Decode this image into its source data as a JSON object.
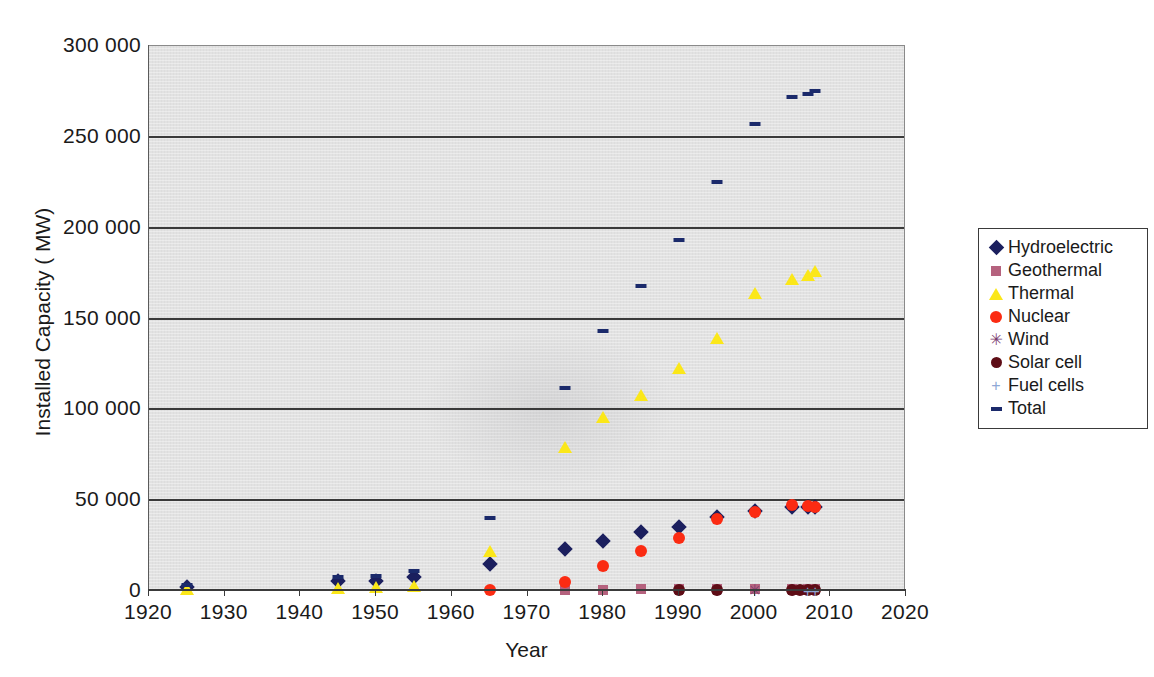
{
  "chart_data": {
    "type": "scatter",
    "title": "",
    "xlabel": "Year",
    "ylabel": "Installed Capacity ( MW)",
    "xlim": [
      1920,
      2020
    ],
    "ylim": [
      0,
      300000
    ],
    "xticks": [
      "1920",
      "1930",
      "1940",
      "1950",
      "1960",
      "1970",
      "1980",
      "1990",
      "2000",
      "2010",
      "2020"
    ],
    "yticks": [
      "0",
      "50 000",
      "100 000",
      "150 000",
      "200 000",
      "250 000",
      "300 000"
    ],
    "ytick_values": [
      0,
      50000,
      100000,
      150000,
      200000,
      250000,
      300000
    ],
    "grid": "horizontal",
    "legend_position": "right-outside",
    "series": [
      {
        "name": "Hydroelectric",
        "color": "#1b1f5e",
        "marker": "diamond",
        "points": [
          {
            "x": 1925,
            "y": 2000
          },
          {
            "x": 1945,
            "y": 5500
          },
          {
            "x": 1950,
            "y": 5500
          },
          {
            "x": 1955,
            "y": 7500
          },
          {
            "x": 1965,
            "y": 15000
          },
          {
            "x": 1975,
            "y": 23000
          },
          {
            "x": 1980,
            "y": 27500
          },
          {
            "x": 1985,
            "y": 32500
          },
          {
            "x": 1990,
            "y": 35500
          },
          {
            "x": 1995,
            "y": 41000
          },
          {
            "x": 2000,
            "y": 44000
          },
          {
            "x": 2005,
            "y": 46500
          },
          {
            "x": 2007,
            "y": 46500
          },
          {
            "x": 2008,
            "y": 46500
          }
        ]
      },
      {
        "name": "Geothermal",
        "color": "#b5627e",
        "marker": "square",
        "points": [
          {
            "x": 1975,
            "y": 500
          },
          {
            "x": 1980,
            "y": 700
          },
          {
            "x": 1985,
            "y": 900
          },
          {
            "x": 1990,
            "y": 1000
          },
          {
            "x": 1995,
            "y": 1100
          },
          {
            "x": 2000,
            "y": 1200
          },
          {
            "x": 2005,
            "y": 1300
          },
          {
            "x": 2007,
            "y": 1300
          },
          {
            "x": 2008,
            "y": 1300
          }
        ]
      },
      {
        "name": "Thermal",
        "color": "#fbe719",
        "marker": "triangle",
        "points": [
          {
            "x": 1925,
            "y": 1000
          },
          {
            "x": 1945,
            "y": 1500
          },
          {
            "x": 1950,
            "y": 2000
          },
          {
            "x": 1955,
            "y": 2500
          },
          {
            "x": 1965,
            "y": 22000
          },
          {
            "x": 1975,
            "y": 79000
          },
          {
            "x": 1980,
            "y": 96000
          },
          {
            "x": 1985,
            "y": 108000
          },
          {
            "x": 1990,
            "y": 123000
          },
          {
            "x": 1995,
            "y": 139000
          },
          {
            "x": 2000,
            "y": 164000
          },
          {
            "x": 2005,
            "y": 172000
          },
          {
            "x": 2007,
            "y": 174000
          },
          {
            "x": 2008,
            "y": 176000
          }
        ]
      },
      {
        "name": "Nuclear",
        "color": "#fb2b12",
        "marker": "circle",
        "points": [
          {
            "x": 1965,
            "y": 500
          },
          {
            "x": 1975,
            "y": 5000
          },
          {
            "x": 1980,
            "y": 14000
          },
          {
            "x": 1985,
            "y": 22000
          },
          {
            "x": 1990,
            "y": 29000
          },
          {
            "x": 1995,
            "y": 39500
          },
          {
            "x": 2000,
            "y": 43500
          },
          {
            "x": 2005,
            "y": 47500
          },
          {
            "x": 2007,
            "y": 47000
          },
          {
            "x": 2008,
            "y": 46000
          }
        ]
      },
      {
        "name": "Wind",
        "color": "#7a3a6e",
        "marker": "asterisk",
        "points": [
          {
            "x": 1995,
            "y": 300
          },
          {
            "x": 2000,
            "y": 400
          },
          {
            "x": 2005,
            "y": 500
          },
          {
            "x": 2007,
            "y": 600
          },
          {
            "x": 2008,
            "y": 700
          }
        ]
      },
      {
        "name": "Solar cell",
        "color": "#5e0d16",
        "marker": "circle",
        "points": [
          {
            "x": 1990,
            "y": 300
          },
          {
            "x": 1995,
            "y": 400
          },
          {
            "x": 2005,
            "y": 500
          },
          {
            "x": 2006,
            "y": 500
          },
          {
            "x": 2007,
            "y": 600
          },
          {
            "x": 2008,
            "y": 600
          }
        ]
      },
      {
        "name": "Fuel cells",
        "color": "#8fa8d6",
        "marker": "plus",
        "points": [
          {
            "x": 2007,
            "y": 200
          },
          {
            "x": 2008,
            "y": 200
          }
        ]
      },
      {
        "name": "Total",
        "color": "#1b2a6b",
        "marker": "dash",
        "points": [
          {
            "x": 1925,
            "y": 3500
          },
          {
            "x": 1945,
            "y": 7500
          },
          {
            "x": 1950,
            "y": 8500
          },
          {
            "x": 1955,
            "y": 11000
          },
          {
            "x": 1965,
            "y": 40000
          },
          {
            "x": 1975,
            "y": 112000
          },
          {
            "x": 1980,
            "y": 143000
          },
          {
            "x": 1985,
            "y": 168000
          },
          {
            "x": 1990,
            "y": 193000
          },
          {
            "x": 1995,
            "y": 225000
          },
          {
            "x": 2000,
            "y": 257000
          },
          {
            "x": 2005,
            "y": 272000
          },
          {
            "x": 2007,
            "y": 273500
          },
          {
            "x": 2008,
            "y": 275000
          }
        ]
      }
    ]
  },
  "legend": {
    "items": [
      {
        "label": "Hydroelectric",
        "marker": "diamond",
        "color": "#1b1f5e"
      },
      {
        "label": "Geothermal",
        "marker": "square",
        "color": "#b5627e"
      },
      {
        "label": "Thermal",
        "marker": "triangle",
        "color": "#fbe719"
      },
      {
        "label": "Nuclear",
        "marker": "circle",
        "color": "#fb2b12"
      },
      {
        "label": "Wind",
        "marker": "asterisk",
        "color": "#7a3a6e"
      },
      {
        "label": "Solar cell",
        "marker": "solar",
        "color": "#5e0d16"
      },
      {
        "label": "Fuel cells",
        "marker": "plus",
        "color": "#8fa8d6"
      },
      {
        "label": "Total",
        "marker": "dash",
        "color": "#1b2a6b"
      }
    ]
  },
  "axes": {
    "y_title": "Installed Capacity ( MW)",
    "x_title": "Year"
  }
}
